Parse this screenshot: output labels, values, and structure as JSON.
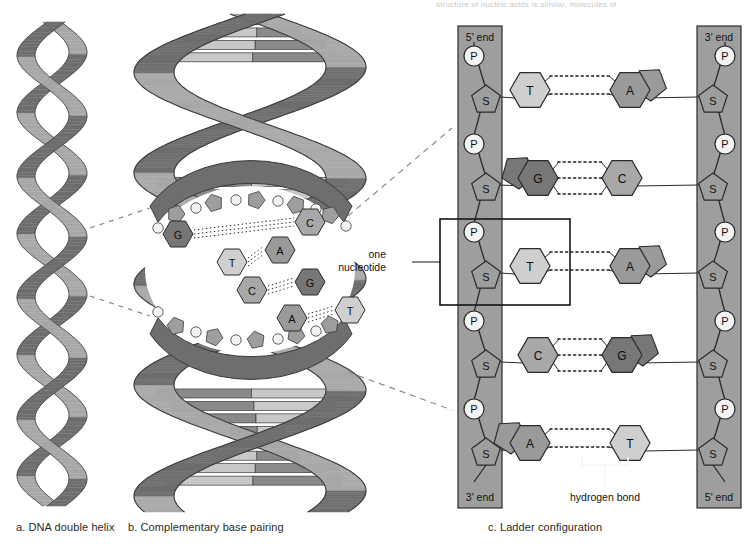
{
  "figure": {
    "top_cut_text": "structure of nucleic acids is similar, molecules of",
    "captions": [
      {
        "id": "a",
        "text": "a. DNA double helix",
        "x": 16,
        "y": 527
      },
      {
        "id": "b",
        "text": "b. Complementary base pairing",
        "x": 128,
        "y": 527
      },
      {
        "id": "c",
        "text": "c. Ladder configuration",
        "x": 488,
        "y": 527
      }
    ]
  },
  "colors": {
    "backbone_band": "#9e9e9e",
    "ribbon_light": "#a8a8a8",
    "ribbon_dark": "#6e6e6e",
    "base_T": "#cfcfcf",
    "base_A": "#9a9a9a",
    "base_C": "#a8a8a8",
    "base_G": "#777777",
    "phosphate": "#f4f4f4",
    "sugar": "#9e9e9e",
    "outline": "#2b2b2b",
    "rung_light": "#c8c8c8",
    "rung_dark": "#8a8a8a"
  },
  "panel_a": {
    "name": "DNA double helix",
    "strand_count": 2,
    "turns": 4
  },
  "panel_b": {
    "name": "Complementary base pairing",
    "visible_base_pairs": [
      {
        "left": "G",
        "right": "C"
      },
      {
        "left": "T",
        "right": "A"
      },
      {
        "left": "C",
        "right": "G"
      },
      {
        "left": "A",
        "right": "T"
      }
    ]
  },
  "panel_c": {
    "name": "Ladder configuration",
    "left_strand": {
      "top_end_label": "5' end",
      "bottom_end_label": "3' end",
      "units": [
        "P",
        "S",
        "P",
        "S",
        "P",
        "S",
        "P",
        "S",
        "P",
        "S"
      ]
    },
    "right_strand": {
      "top_end_label": "3' end",
      "bottom_end_label": "5' end",
      "units": [
        "P",
        "S",
        "P",
        "S",
        "P",
        "S",
        "P",
        "S",
        "P",
        "S"
      ]
    },
    "rungs": [
      {
        "left_base": "T",
        "right_base": "A",
        "hydrogen_bonds": 2
      },
      {
        "left_base": "G",
        "right_base": "C",
        "hydrogen_bonds": 3
      },
      {
        "left_base": "T",
        "right_base": "A",
        "hydrogen_bonds": 2
      },
      {
        "left_base": "C",
        "right_base": "G",
        "hydrogen_bonds": 3
      },
      {
        "left_base": "A",
        "right_base": "T",
        "hydrogen_bonds": 2
      }
    ],
    "annotations": {
      "nucleotide_label_line1": "one",
      "nucleotide_label_line2": "nucleotide",
      "hydrogen_bond_label": "hydrogen bond"
    },
    "sugar_letter": "S",
    "phosphate_letter": "P"
  }
}
